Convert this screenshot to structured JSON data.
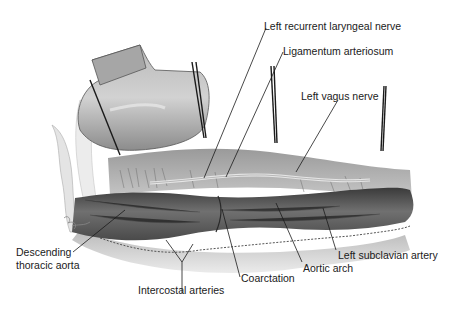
{
  "figure": {
    "signature": "artist signature"
  },
  "labels": {
    "left_recurrent_laryngeal_nerve": "Left recurrent laryngeal nerve",
    "ligamentum_arteriosum": "Ligamentum arteriosum",
    "left_vagus_nerve": "Left vagus nerve",
    "descending_line1": "Descending",
    "descending_line2": "thoracic aorta",
    "intercostal_arteries": "Intercostal arteries",
    "coarctation": "Coarctation",
    "aortic_arch": "Aortic arch",
    "left_subclavian_artery": "Left subclavian artery"
  }
}
